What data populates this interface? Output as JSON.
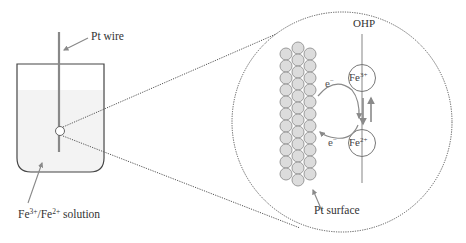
{
  "labels": {
    "pt_wire": "Pt wire",
    "solution": {
      "base1": "Fe",
      "sup1": "3+",
      "sep": "/Fe",
      "sup2": "2+",
      "tail": " solution"
    },
    "ohp": "OHP",
    "pt_surface": "Pt surface",
    "ion_top": {
      "base": "Fe",
      "charge": "3+"
    },
    "ion_bottom": {
      "base": "Fe",
      "charge": "2+"
    },
    "electron_top": {
      "base": "e",
      "charge": "−"
    },
    "electron_bottom": {
      "base": "e",
      "charge": "−"
    }
  },
  "colors": {
    "outline": "#444444",
    "wire": "#888888",
    "atom_fill": "#dcdcdc",
    "atom_stroke": "#9a9a9a",
    "arrow": "#8a8a8a",
    "solution_fill": "#f3f3f3",
    "dotted": "#555555"
  },
  "geometry": {
    "zoom_circle": {
      "cx": 342,
      "cy": 122,
      "r": 110
    },
    "atom_radius": 6,
    "atom_columns": [
      {
        "x": 286,
        "y_start": 54,
        "count": 11
      },
      {
        "x": 298,
        "y_start": 48,
        "count": 12
      },
      {
        "x": 310,
        "y_start": 54,
        "count": 11
      }
    ],
    "atom_step": 12
  }
}
